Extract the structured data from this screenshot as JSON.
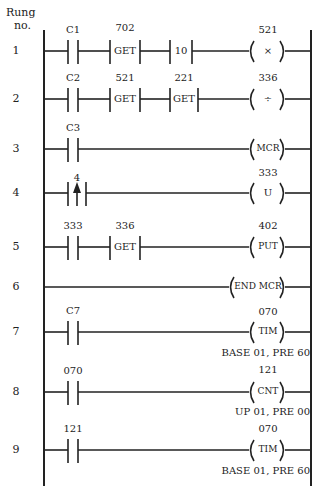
{
  "header": {
    "line1": "Rung",
    "line2": "no."
  },
  "rungs": [
    {
      "no": "1",
      "elements": [
        {
          "type": "contact",
          "label": "C1"
        },
        {
          "type": "block",
          "label": "702",
          "text": "GET"
        },
        {
          "type": "block",
          "label": "",
          "text": "10"
        },
        {
          "type": "coil",
          "label": "521",
          "text": "×"
        }
      ]
    },
    {
      "no": "2",
      "elements": [
        {
          "type": "contact",
          "label": "C2"
        },
        {
          "type": "block",
          "label": "521",
          "text": "GET"
        },
        {
          "type": "block",
          "label": "221",
          "text": "GET"
        },
        {
          "type": "coil",
          "label": "336",
          "text": "÷"
        }
      ]
    },
    {
      "no": "3",
      "elements": [
        {
          "type": "contact",
          "label": "C3"
        },
        {
          "type": "coil",
          "label": "",
          "text": "MCR"
        }
      ]
    },
    {
      "no": "4",
      "elements": [
        {
          "type": "transition-contact",
          "label": "4"
        },
        {
          "type": "coil",
          "label": "333",
          "text": "U"
        }
      ]
    },
    {
      "no": "5",
      "elements": [
        {
          "type": "contact",
          "label": "333"
        },
        {
          "type": "block",
          "label": "336",
          "text": "GET"
        },
        {
          "type": "coil",
          "label": "402",
          "text": "PUT"
        }
      ]
    },
    {
      "no": "6",
      "elements": [
        {
          "type": "coil",
          "label": "",
          "text": "END MCR"
        }
      ]
    },
    {
      "no": "7",
      "elements": [
        {
          "type": "contact",
          "label": "C7"
        },
        {
          "type": "coil",
          "label": "070",
          "text": "TIM",
          "sub": "BASE 01, PRE 60"
        }
      ]
    },
    {
      "no": "8",
      "elements": [
        {
          "type": "contact",
          "label": "070"
        },
        {
          "type": "coil",
          "label": "121",
          "text": "CNT",
          "sub": "UP 01, PRE 00"
        }
      ]
    },
    {
      "no": "9",
      "elements": [
        {
          "type": "contact",
          "label": "121"
        },
        {
          "type": "coil",
          "label": "070",
          "text": "TIM",
          "sub": "BASE 01, PRE 60"
        }
      ]
    }
  ]
}
